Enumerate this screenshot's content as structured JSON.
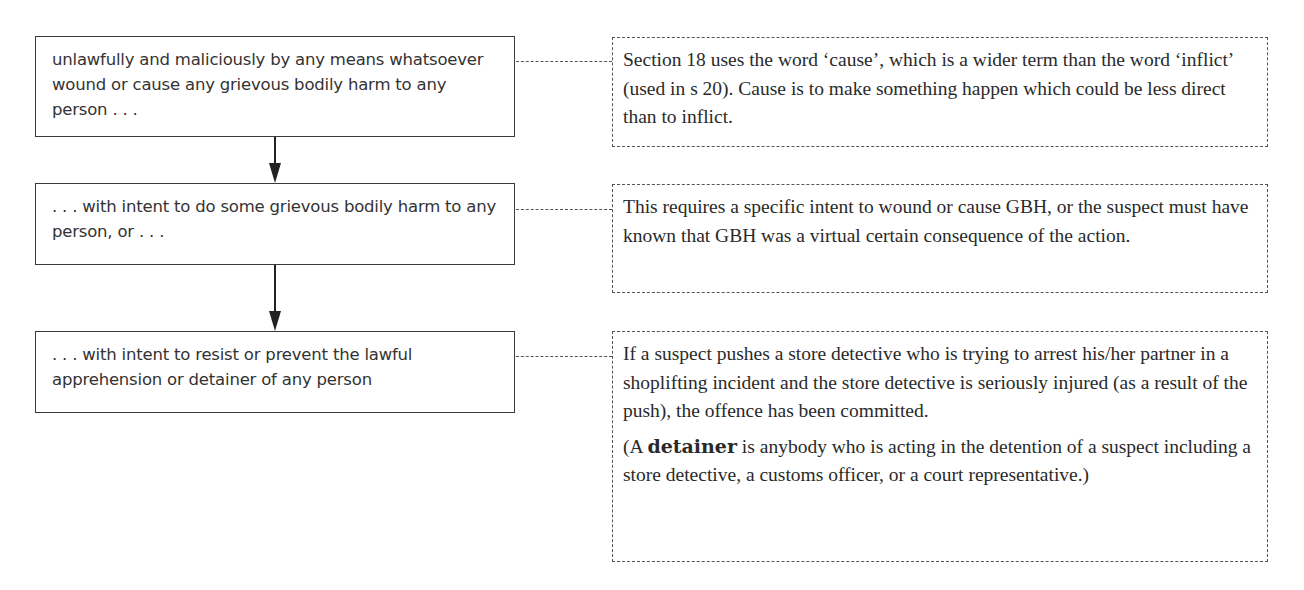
{
  "diagram": {
    "steps": [
      {
        "text": "unlawfully and maliciously by any means whatsoever wound or cause any grievous bodily harm to any person . . .",
        "note": {
          "paragraphs": [
            "Section 18 uses the word ‘cause’, which is a wider term than the word ‘inflict’ (used in s 20). Cause is to make something happen which could be less direct than to inflict."
          ]
        }
      },
      {
        "text": ". . . with intent to do some grievous bodily harm to any person, or . . .",
        "note": {
          "paragraphs": [
            "This requires a specific intent to wound or cause GBH, or the suspect must have known that GBH was a virtual certain consequence of the action."
          ]
        }
      },
      {
        "text": ". . . with intent to resist or prevent the lawful apprehension or detainer of any person",
        "note": {
          "paragraphs": [
            "If a suspect pushes a store detective who is trying to arrest his/her partner in a shoplifting incident and the store detective is seriously injured (as a result of the push), the offence has been committed."
          ],
          "definition": {
            "open": "(A ",
            "term": "detainer",
            "rest": " is anybody who is acting in the detention of a suspect including a store detective, a customs officer, or a court representative.)"
          }
        }
      }
    ],
    "colors": {
      "box_border": "#3a3a3a",
      "dashed_border": "#555555",
      "arrow": "#222222",
      "text": "#333333"
    }
  }
}
